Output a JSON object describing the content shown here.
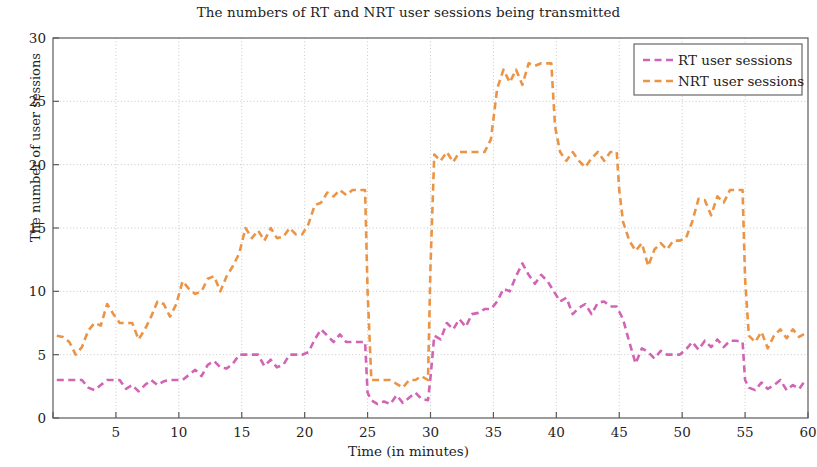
{
  "chart_data": {
    "type": "line",
    "title": "The numbers of RT and NRT user sessions being transmitted",
    "xlabel": "Time (in minutes)",
    "ylabel": "The number of user sessions",
    "xlim": [
      0,
      60
    ],
    "ylim": [
      0,
      30
    ],
    "xticks": [
      0,
      5,
      10,
      15,
      20,
      25,
      30,
      35,
      40,
      45,
      50,
      55,
      60
    ],
    "xtick_labels": [
      "",
      "5",
      "10",
      "15",
      "20",
      "25",
      "30",
      "35",
      "40",
      "45",
      "50",
      "55",
      "60"
    ],
    "yticks": [
      0,
      5,
      10,
      15,
      20,
      25,
      30
    ],
    "ytick_labels": [
      "0",
      "5",
      "10",
      "15",
      "20",
      "25",
      "30"
    ],
    "grid": true,
    "grid_style": "dotted",
    "grid_color": "#c8c8c8",
    "legend_position": "top-right",
    "axes_color": "#5a5a5a",
    "background": "#ffffff",
    "series": [
      {
        "name": "RT user sessions",
        "color": "#d264b6",
        "linestyle": "dashed",
        "x": [
          0.3,
          0.8,
          1.3,
          1.8,
          2.3,
          2.8,
          3.3,
          3.8,
          4.3,
          4.8,
          5.3,
          5.8,
          6.3,
          6.8,
          7.3,
          7.8,
          8.3,
          8.8,
          9.3,
          9.8,
          10.3,
          10.8,
          11.3,
          11.8,
          12.3,
          12.8,
          13.3,
          13.8,
          14.3,
          14.8,
          15.3,
          15.8,
          16.3,
          16.8,
          17.3,
          17.8,
          18.3,
          18.8,
          19.3,
          19.8,
          20.3,
          20.8,
          21.3,
          21.8,
          22.3,
          22.8,
          23.3,
          23.8,
          24.3,
          24.8,
          25.0,
          25.3,
          25.8,
          26.3,
          26.8,
          27.3,
          27.8,
          28.3,
          28.8,
          29.3,
          29.8,
          30.0,
          30.3,
          30.8,
          31.3,
          31.8,
          32.3,
          32.8,
          33.3,
          33.8,
          34.3,
          34.8,
          35.3,
          35.8,
          36.3,
          36.8,
          37.3,
          37.8,
          38.3,
          38.8,
          39.3,
          39.8,
          40.3,
          40.8,
          41.3,
          41.8,
          42.3,
          42.8,
          43.3,
          43.8,
          44.3,
          44.8,
          45.3,
          45.8,
          46.3,
          46.8,
          47.3,
          47.8,
          48.3,
          48.8,
          49.3,
          49.8,
          50.3,
          50.8,
          51.3,
          51.8,
          52.3,
          52.8,
          53.3,
          53.8,
          54.3,
          54.8,
          55.0,
          55.3,
          55.8,
          56.3,
          56.8,
          57.3,
          57.8,
          58.3,
          58.8,
          59.3,
          59.8
        ],
        "y": [
          3.0,
          3.0,
          3.0,
          3.0,
          3.0,
          2.4,
          2.2,
          2.6,
          3.0,
          3.0,
          3.0,
          2.3,
          2.6,
          2.1,
          2.6,
          3.0,
          2.6,
          2.9,
          3.0,
          3.0,
          3.0,
          3.4,
          3.8,
          3.3,
          4.2,
          4.5,
          4.0,
          3.9,
          4.3,
          5.0,
          5.0,
          5.0,
          5.0,
          4.1,
          4.6,
          4.0,
          4.2,
          5.0,
          5.0,
          5.0,
          5.2,
          6.2,
          7.0,
          6.5,
          6.0,
          6.6,
          6.0,
          6.0,
          6.0,
          6.0,
          2.0,
          1.4,
          1.1,
          1.3,
          1.1,
          1.8,
          1.2,
          1.6,
          2.0,
          1.5,
          1.4,
          3.2,
          6.5,
          6.2,
          7.5,
          7.0,
          7.8,
          7.2,
          8.2,
          8.3,
          8.6,
          8.6,
          9.2,
          10.2,
          10.0,
          11.2,
          12.2,
          11.3,
          10.6,
          11.3,
          10.8,
          10.0,
          9.2,
          9.5,
          8.2,
          8.7,
          9.0,
          8.2,
          9.1,
          9.2,
          8.8,
          8.8,
          7.8,
          6.0,
          4.3,
          5.5,
          5.2,
          4.7,
          5.3,
          5.0,
          5.0,
          5.0,
          5.4,
          6.0,
          5.4,
          6.1,
          5.6,
          6.2,
          5.6,
          6.1,
          6.1,
          6.0,
          3.0,
          2.4,
          2.2,
          2.8,
          2.3,
          2.6,
          3.0,
          2.2,
          2.6,
          2.3,
          3.0
        ]
      },
      {
        "name": "NRT user sessions",
        "color": "#eb9446",
        "linestyle": "dashed",
        "x": [
          0.3,
          0.8,
          1.3,
          1.8,
          2.3,
          2.8,
          3.3,
          3.8,
          4.3,
          4.8,
          5.3,
          5.8,
          6.3,
          6.8,
          7.3,
          7.8,
          8.3,
          8.8,
          9.3,
          9.8,
          10.3,
          10.8,
          11.3,
          11.8,
          12.3,
          12.8,
          13.3,
          13.8,
          14.3,
          14.8,
          15.3,
          15.8,
          16.3,
          16.8,
          17.3,
          17.8,
          18.3,
          18.8,
          19.3,
          19.8,
          20.3,
          20.8,
          21.3,
          21.8,
          22.3,
          22.8,
          23.3,
          23.8,
          24.3,
          24.8,
          25.0,
          25.3,
          25.8,
          26.3,
          26.8,
          27.3,
          27.8,
          28.3,
          28.8,
          29.3,
          29.8,
          30.0,
          30.3,
          30.8,
          31.3,
          31.8,
          32.3,
          32.8,
          33.3,
          33.8,
          34.3,
          34.8,
          35.3,
          35.8,
          36.3,
          36.8,
          37.3,
          37.8,
          38.3,
          38.8,
          39.3,
          39.6,
          39.9,
          40.3,
          40.8,
          41.3,
          41.8,
          42.3,
          42.8,
          43.3,
          43.8,
          44.3,
          44.8,
          45.0,
          45.3,
          45.8,
          46.3,
          46.8,
          47.3,
          47.8,
          48.3,
          48.8,
          49.3,
          49.8,
          50.3,
          50.8,
          51.3,
          51.8,
          52.3,
          52.8,
          53.3,
          53.8,
          54.3,
          54.8,
          55.0,
          55.3,
          55.8,
          56.3,
          56.8,
          57.3,
          57.8,
          58.3,
          58.8,
          59.3,
          59.8
        ],
        "y": [
          6.5,
          6.4,
          6.0,
          5.0,
          5.6,
          6.9,
          7.5,
          7.3,
          9.0,
          8.2,
          7.5,
          7.5,
          7.5,
          6.2,
          7.0,
          8.0,
          9.2,
          9.0,
          8.0,
          9.0,
          10.8,
          10.2,
          9.8,
          10.0,
          11.0,
          11.2,
          10.0,
          11.2,
          12.0,
          13.0,
          15.0,
          14.2,
          14.8,
          14.0,
          15.0,
          14.2,
          14.3,
          15.0,
          14.5,
          14.5,
          15.3,
          16.8,
          17.0,
          17.8,
          17.5,
          18.0,
          17.6,
          18.0,
          18.0,
          18.0,
          10.0,
          3.0,
          3.0,
          3.0,
          3.0,
          2.7,
          2.4,
          3.0,
          3.0,
          3.3,
          3.0,
          12.0,
          20.8,
          20.3,
          21.0,
          20.2,
          21.0,
          21.0,
          21.0,
          21.0,
          21.0,
          22.0,
          26.0,
          27.5,
          26.5,
          27.5,
          26.3,
          28.0,
          27.8,
          28.0,
          28.0,
          28.0,
          23.0,
          21.0,
          20.3,
          21.0,
          20.3,
          19.8,
          20.5,
          21.0,
          20.3,
          21.0,
          21.0,
          18.0,
          15.5,
          14.0,
          13.2,
          13.8,
          12.0,
          13.3,
          13.8,
          13.3,
          14.0,
          14.0,
          14.2,
          15.5,
          17.3,
          17.2,
          16.0,
          17.5,
          17.0,
          18.0,
          18.0,
          18.0,
          11.0,
          6.5,
          6.0,
          6.8,
          5.5,
          6.5,
          7.0,
          6.3,
          7.0,
          6.4,
          6.7
        ]
      }
    ]
  },
  "legend": {
    "entries": [
      {
        "label": "RT user sessions",
        "color": "#d264b6"
      },
      {
        "label": "NRT user sessions",
        "color": "#eb9446"
      }
    ]
  }
}
